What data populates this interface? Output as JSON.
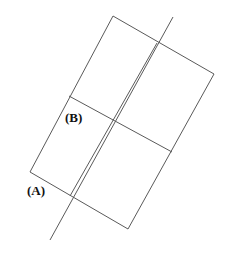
{
  "figure": {
    "title": "",
    "background_color": "#ffffff",
    "stroke_color": "#5a5a5a",
    "stroke_width": 1,
    "labels": {
      "a": "(A)",
      "b": "(B)"
    },
    "shapes": {
      "parallelogram": {
        "name": "outer-parallelogram",
        "points": "113,16 214,74 128,229 30,172"
      },
      "divider_vertical": {
        "name": "vertical-divider",
        "x1": 157,
        "y1": 43,
        "x2": 70,
        "y2": 196
      },
      "divider_horizontal": {
        "name": "horizontal-divider",
        "x1": 69,
        "y1": 96,
        "x2": 172,
        "y2": 152
      },
      "transversal": {
        "name": "diagonal-transversal-line",
        "x1": 173,
        "y1": 17,
        "x2": 50,
        "y2": 240
      }
    }
  }
}
